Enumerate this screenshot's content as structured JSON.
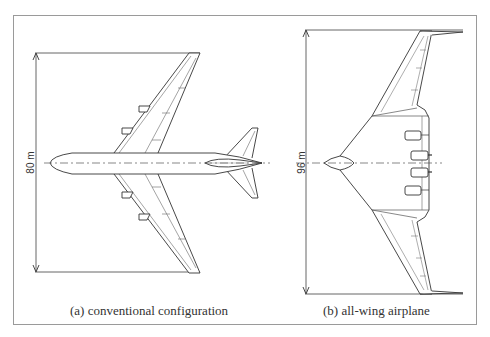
{
  "figure": {
    "panels": [
      {
        "id": "a",
        "caption": "(a) conventional configuration",
        "dimension_label": "80 m"
      },
      {
        "id": "b",
        "caption": "(b) all-wing airplane",
        "dimension_label": "96 m"
      }
    ],
    "colors": {
      "line": "#333333",
      "frame": "#999999",
      "background": "#ffffff"
    }
  }
}
